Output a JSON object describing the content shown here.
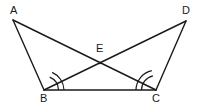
{
  "figure": {
    "background_color": "#ffffff",
    "stroke_color": "#1a1a1a",
    "canvas": {
      "width": 200,
      "height": 109
    },
    "points": [
      {
        "id": "A",
        "label": "A",
        "x": 13,
        "y": 20,
        "label_x": 10,
        "label_y": 5
      },
      {
        "id": "D",
        "label": "D",
        "x": 186,
        "y": 21,
        "label_x": 182,
        "label_y": 5
      },
      {
        "id": "B",
        "label": "B",
        "x": 44,
        "y": 90,
        "label_x": 40,
        "label_y": 93
      },
      {
        "id": "C",
        "label": "C",
        "x": 156,
        "y": 90,
        "label_x": 152,
        "label_y": 93
      },
      {
        "id": "E",
        "label": "E",
        "x": 100,
        "y": 63,
        "label_x": 96,
        "label_y": 43
      }
    ],
    "segments": [
      {
        "id": "AB",
        "from": "A",
        "to": "B"
      },
      {
        "id": "AC",
        "from": "A",
        "to": "C"
      },
      {
        "id": "DB",
        "from": "D",
        "to": "B"
      },
      {
        "id": "DC",
        "from": "D",
        "to": "C"
      },
      {
        "id": "BC",
        "from": "B",
        "to": "C"
      }
    ],
    "angle_marks": [
      {
        "id": "angle-B",
        "vertex": "B",
        "rays": [
          "A",
          "C"
        ],
        "arcs": 2
      },
      {
        "id": "angle-C",
        "vertex": "C",
        "rays": [
          "D",
          "B"
        ],
        "arcs": 2
      }
    ]
  }
}
